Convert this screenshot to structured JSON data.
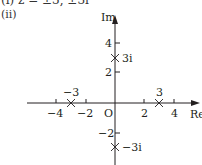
{
  "header": {
    "prev_part_text": "(i)  z = ±3, ±3i",
    "part_label": "(ii)"
  },
  "diagram": {
    "type": "argand-diagram",
    "axes": {
      "x_label": "Re",
      "y_label": "Im",
      "origin_label": "O",
      "x_ticks": [
        {
          "value": -4,
          "label": "−4"
        },
        {
          "value": -2,
          "label": "−2"
        },
        {
          "value": 2,
          "label": "2"
        },
        {
          "value": 4,
          "label": "4"
        }
      ],
      "y_ticks": [
        {
          "value": 4,
          "label": "4"
        },
        {
          "value": 2,
          "label": "2"
        },
        {
          "value": -2,
          "label": "−2"
        }
      ]
    },
    "points": [
      {
        "re": -3,
        "im": 0,
        "label": "−3",
        "marker": "cross"
      },
      {
        "re": 3,
        "im": 0,
        "label": "3",
        "marker": "cross"
      },
      {
        "re": 0,
        "im": 3,
        "label": "3i",
        "marker": "cross"
      },
      {
        "re": 0,
        "im": -3,
        "label": "−3i",
        "marker": "cross"
      }
    ],
    "colors": {
      "ink": "#231f20",
      "text": "#333333"
    }
  }
}
